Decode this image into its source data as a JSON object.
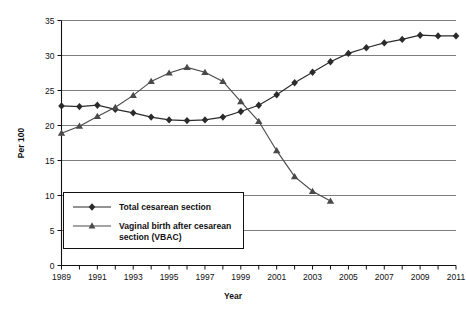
{
  "chart_data": {
    "type": "line",
    "title": "",
    "xlabel": "Year",
    "ylabel": "Per 100",
    "xlim": [
      1989,
      2011
    ],
    "ylim": [
      0,
      35
    ],
    "ytick_step": 5,
    "xtick_step": 1,
    "xtick_label_step": 2,
    "grid": "horizontal",
    "legend_position": "inside-lower-left",
    "x": [
      1989,
      1990,
      1991,
      1992,
      1993,
      1994,
      1995,
      1996,
      1997,
      1998,
      1999,
      2000,
      2001,
      2002,
      2003,
      2004,
      2005,
      2006,
      2007,
      2008,
      2009,
      2010,
      2011
    ],
    "xtick_labels": [
      "1989",
      "1990",
      "1991",
      "1992",
      "1993",
      "1994",
      "1995",
      "1996",
      "1997",
      "1998",
      "1999",
      "2000",
      "2001",
      "2002",
      "2003",
      "2004",
      "2005",
      "2006",
      "2007",
      "2008",
      "2009",
      "2010",
      "2011"
    ],
    "xtick_labels_shown": [
      "1989",
      "1991",
      "1993",
      "1995",
      "1997",
      "1999",
      "2001",
      "2003",
      "2005",
      "2007",
      "2009",
      "2011"
    ],
    "ytick_labels": [
      "0",
      "5",
      "10",
      "15",
      "20",
      "25",
      "30",
      "35"
    ],
    "series": [
      {
        "name": "Total cesarean section",
        "marker": "diamond",
        "color": "#2b2b2b",
        "x": [
          1989,
          1990,
          1991,
          1992,
          1993,
          1994,
          1995,
          1996,
          1997,
          1998,
          1999,
          2000,
          2001,
          2002,
          2003,
          2004,
          2005,
          2006,
          2007,
          2008,
          2009,
          2010,
          2011
        ],
        "values": [
          22.8,
          22.7,
          22.9,
          22.3,
          21.8,
          21.2,
          20.8,
          20.7,
          20.8,
          21.2,
          22.0,
          22.9,
          24.4,
          26.1,
          27.6,
          29.1,
          30.3,
          31.1,
          31.8,
          32.3,
          32.9,
          32.8,
          32.8
        ]
      },
      {
        "name": "Vaginal birth after cesarean section (VBAC)",
        "marker": "triangle",
        "color": "#4a4a4a",
        "x": [
          1989,
          1990,
          1991,
          1992,
          1993,
          1994,
          1995,
          1996,
          1997,
          1998,
          1999,
          2000,
          2001,
          2002,
          2003,
          2004
        ],
        "values": [
          18.9,
          19.9,
          21.3,
          22.6,
          24.3,
          26.3,
          27.5,
          28.3,
          27.6,
          26.3,
          23.4,
          20.6,
          16.4,
          12.7,
          10.6,
          9.2
        ]
      }
    ],
    "legend_entries": [
      {
        "label": "Total cesarean section",
        "marker": "diamond"
      },
      {
        "label": "Vaginal birth after cesarean section (VBAC)",
        "marker": "triangle"
      }
    ]
  },
  "legend": {
    "entry_1_line_1": "Total cesarean section",
    "entry_2_line_1": "Vaginal birth after cesarean",
    "entry_2_line_2": "section (VBAC)"
  },
  "axes": {
    "y_title": "Per 100",
    "x_title": "Year"
  }
}
